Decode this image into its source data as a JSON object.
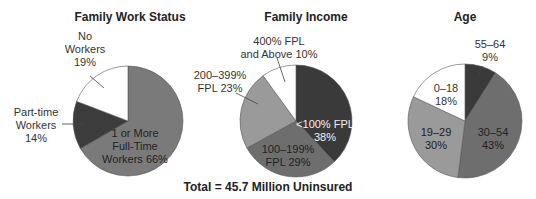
{
  "chart_data": [
    {
      "type": "pie",
      "title": "Family Work Status",
      "categories": [
        "1 or More Full-Time Workers",
        "Part-time Workers",
        "No Workers"
      ],
      "values": [
        66,
        14,
        19
      ],
      "unit": "%",
      "colors": [
        "#7a7a7a",
        "#3c3c3c",
        "#ffffff"
      ]
    },
    {
      "type": "pie",
      "title": "Family Income",
      "categories": [
        "<100% FPL",
        "100–199% FPL",
        "200–399% FPL",
        "400% FPL and Above"
      ],
      "values": [
        38,
        29,
        23,
        10
      ],
      "unit": "%",
      "colors": [
        "#3a3a3a",
        "#6e6e6e",
        "#9a9a9a",
        "#ffffff"
      ]
    },
    {
      "type": "pie",
      "title": "Age",
      "categories": [
        "55–64",
        "30–54",
        "19–29",
        "0–18"
      ],
      "values": [
        9,
        43,
        30,
        18
      ],
      "unit": "%",
      "colors": [
        "#3a3a3a",
        "#6e6e6e",
        "#9a9a9a",
        "#ffffff"
      ]
    }
  ],
  "charts": {
    "work": {
      "title": "Family Work Status",
      "labels": {
        "full_l1": "1 or More",
        "full_l2": "Full-Time",
        "full_l3": "Workers 66%",
        "part_l1": "Part-time",
        "part_l2": "Workers",
        "part_l3": "14%",
        "none_l1": "No",
        "none_l2": "Workers",
        "none_l3": "19%"
      }
    },
    "income": {
      "title": "Family Income",
      "labels": {
        "lt100_l1": "<100% FPL",
        "lt100_l2": "38%",
        "r100_l1": "100–199%",
        "r100_l2": "FPL 29%",
        "r200_l1": "200–399%",
        "r200_l2": "FPL 23%",
        "r400_l1": "400% FPL",
        "r400_l2": "and Above 10%"
      }
    },
    "age": {
      "title": "Age",
      "labels": {
        "a55_l1": "55–64",
        "a55_l2": "9%",
        "a30_l1": "30–54",
        "a30_l2": "43%",
        "a19_l1": "19–29",
        "a19_l2": "30%",
        "a0_l1": "0–18",
        "a0_l2": "18%"
      }
    }
  },
  "footer": {
    "total": "Total = 45.7 Million Uninsured"
  }
}
